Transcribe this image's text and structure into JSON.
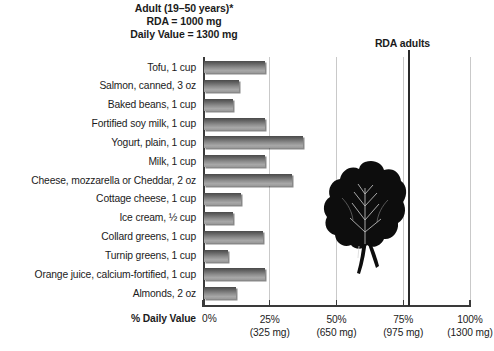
{
  "header": {
    "line1": "Adult (19–50 years)*",
    "line2": "RDA = 1000 mg",
    "line3": "Daily Value = 1300 mg"
  },
  "rda_marker": {
    "label": "RDA adults",
    "value_percent": 77
  },
  "axis": {
    "title": "% Daily Value",
    "zero_label": "0%",
    "ticks": [
      {
        "pct": "25%",
        "mg": "(325 mg)"
      },
      {
        "pct": "50%",
        "mg": "(650 mg)"
      },
      {
        "pct": "75%",
        "mg": "(975 mg)"
      },
      {
        "pct": "100%",
        "mg": "(1300 mg)"
      }
    ]
  },
  "illustration": {
    "name": "leafy-greens-photo",
    "color": "#101010"
  },
  "chart_data": {
    "type": "bar",
    "orientation": "horizontal",
    "title": "Adult (19–50 years)* RDA = 1000 mg  Daily Value = 1300 mg",
    "xlabel": "% Daily Value",
    "ylabel": "",
    "xlim": [
      0,
      100
    ],
    "grid": true,
    "legend": "none",
    "categories": [
      "Tofu, 1 cup",
      "Salmon, canned, 3 oz",
      "Baked beans, 1 cup",
      "Fortified soy milk, 1 cup",
      "Yogurt, plain, 1 cup",
      "Milk, 1 cup",
      "Cheese, mozzarella or Cheddar, 2 oz",
      "Cottage cheese, 1 cup",
      "Ice cream, ½ cup",
      "Collard greens, 1 cup",
      "Turnip greens, 1 cup",
      "Orange juice, calcium-fortified, 1 cup",
      "Almonds, 2 oz"
    ],
    "values": [
      23,
      13,
      11,
      23,
      37,
      23,
      33,
      14,
      11,
      22,
      9,
      23,
      12
    ],
    "annotations": [
      {
        "label": "RDA adults",
        "x": 77,
        "type": "vline"
      }
    ],
    "tick_values": [
      0,
      25,
      50,
      75,
      100
    ],
    "tick_labels": [
      "0%",
      "25%",
      "50%",
      "75%",
      "100%"
    ],
    "tick_sublabels": [
      "",
      "(325 mg)",
      "(650 mg)",
      "(975 mg)",
      "(1300 mg)"
    ]
  }
}
